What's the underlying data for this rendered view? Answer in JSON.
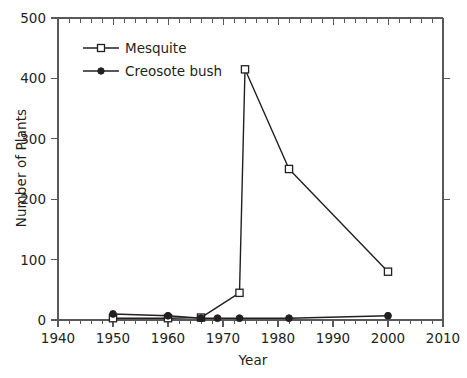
{
  "chart_data": {
    "type": "line",
    "title": "",
    "xlabel": "Year",
    "ylabel": "Number of Plants",
    "xlim": [
      1940,
      2010
    ],
    "ylim": [
      0,
      500
    ],
    "xticks": [
      1940,
      1950,
      1960,
      1970,
      1980,
      1990,
      2000,
      2010
    ],
    "yticks": [
      0,
      100,
      200,
      300,
      400,
      500
    ],
    "xtick_labels": [
      "1940",
      "1950",
      "1960",
      "1970",
      "1980",
      "1990",
      "2000",
      "2010"
    ],
    "ytick_labels": [
      "0",
      "100",
      "200",
      "300",
      "400",
      "500"
    ],
    "grid": false,
    "legend_position": "upper left",
    "minor_ticks_x_interval": 2,
    "series": [
      {
        "name": "Mesquite",
        "marker": "open-square",
        "color": "#231f20",
        "x": [
          1950,
          1960,
          1966,
          1973,
          1974,
          1982,
          2000
        ],
        "values": [
          3,
          3,
          4,
          45,
          415,
          250,
          80
        ]
      },
      {
        "name": "Creosote bush",
        "marker": "filled-circle",
        "color": "#231f20",
        "x": [
          1950,
          1960,
          1966,
          1969,
          1973,
          1982,
          2000
        ],
        "values": [
          10,
          7,
          3,
          3,
          3,
          3,
          7
        ]
      }
    ],
    "legend": [
      {
        "label": "Mesquite",
        "marker": "open-square"
      },
      {
        "label": "Creosote bush",
        "marker": "filled-circle"
      }
    ]
  },
  "axes": {
    "y_title": "Number of Plants",
    "x_title": "Year",
    "y_ticks": [
      {
        "label": "500"
      },
      {
        "label": "400"
      },
      {
        "label": "300"
      },
      {
        "label": "200"
      },
      {
        "label": "100"
      },
      {
        "label": "0"
      }
    ],
    "x_ticks": [
      {
        "label": "1940"
      },
      {
        "label": "1950"
      },
      {
        "label": "1960"
      },
      {
        "label": "1970"
      },
      {
        "label": "1980"
      },
      {
        "label": "1990"
      },
      {
        "label": "2000"
      },
      {
        "label": "2010"
      }
    ]
  },
  "legend": {
    "entries": [
      {
        "label": "Mesquite"
      },
      {
        "label": "Creosote bush"
      }
    ]
  },
  "colors": {
    "ink": "#231f20",
    "axis": "#58595b",
    "background": "#ffffff"
  }
}
